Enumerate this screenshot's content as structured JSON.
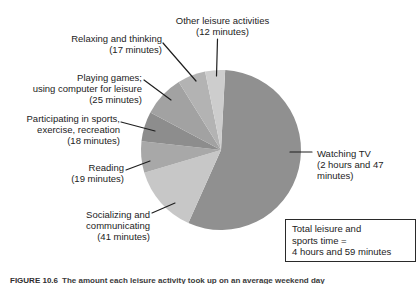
{
  "chart_data": {
    "type": "pie",
    "title": "",
    "unit": "minutes",
    "total_minutes": 299,
    "start_angle_deg": 3,
    "legend_position": "none",
    "labels_style": "outside-with-leader-lines",
    "slices": [
      {
        "name": "Watching TV",
        "minutes": 167,
        "color": "#909090",
        "label": "Watching TV\n(2 hours and 47\nminutes)"
      },
      {
        "name": "Socializing and communicating",
        "minutes": 41,
        "color": "#c7c7c7",
        "label": "Socializing and\ncommunicating\n(41 minutes)"
      },
      {
        "name": "Reading",
        "minutes": 19,
        "color": "#a8a8a8",
        "label": "Reading\n(19 minutes)"
      },
      {
        "name": "Participating in sports, exercise, recreation",
        "minutes": 18,
        "color": "#8d8d8d",
        "label": "Participating in sports,\nexercise, recreation\n(18 minutes)"
      },
      {
        "name": "Playing games; using computer for leisure",
        "minutes": 25,
        "color": "#a2a2a2",
        "label": "Playing games;\nusing computer for leisure\n(25 minutes)"
      },
      {
        "name": "Relaxing and thinking",
        "minutes": 17,
        "color": "#b3b3b3",
        "label": "Relaxing and thinking\n(17 minutes)"
      },
      {
        "name": "Other leisure activities",
        "minutes": 12,
        "color": "#cdcdcd",
        "label": "Other leisure activities\n(12 minutes)"
      }
    ]
  },
  "total_box": {
    "text": "Total leisure and\nsports time =\n4 hours and 59 minutes"
  },
  "caption": {
    "figure_label": "FIGURE 10.6",
    "text": "The amount each leisure activity took up on an average weekend day"
  }
}
